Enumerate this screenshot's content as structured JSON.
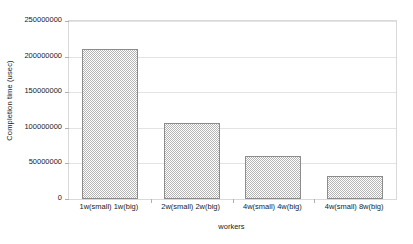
{
  "chart_data": {
    "type": "bar",
    "title": "",
    "xlabel": "workers",
    "ylabel": "Completion time (usec)",
    "categories": [
      "1w(small) 1w(big)",
      "2w(small) 2w(big)",
      "4w(small) 4w(big)",
      "4w(small) 8w(big)"
    ],
    "values": [
      211000000,
      107000000,
      60000000,
      32000000
    ],
    "ylim": [
      0,
      250000000
    ],
    "yticks": [
      0,
      50000000,
      100000000,
      150000000,
      200000000,
      250000000
    ],
    "ytick_labels": [
      "0",
      "50000000",
      "100000000",
      "150000000",
      "200000000",
      "250000000"
    ],
    "grid": true,
    "legend": false,
    "bar_fill": "#b5b5b5",
    "bar_edge": "#8c8c8c",
    "gridline_color": "#e3e3e3",
    "plot_border_color": "#d9d9d9",
    "background": "#ffffff"
  }
}
